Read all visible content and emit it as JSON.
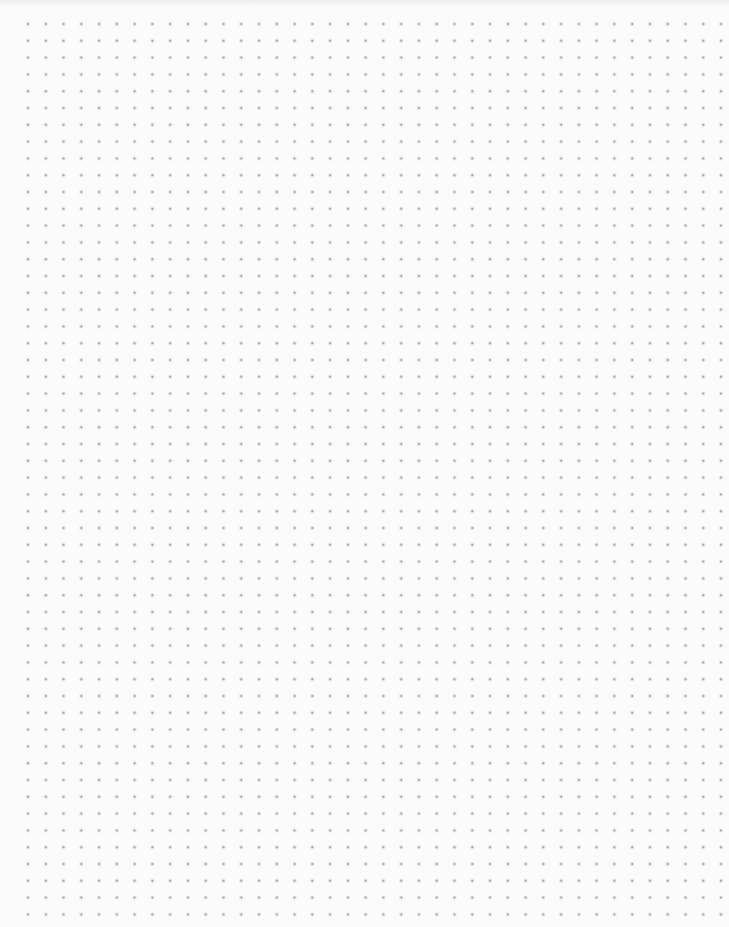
{
  "page": {
    "type": "dot-grid-paper",
    "background_color": "#fbfbfb",
    "top_band_color": "#ececec"
  },
  "grid": {
    "columns": 40,
    "rows": 54,
    "origin_x": 28,
    "origin_y": 24,
    "step_x": 17.77,
    "step_y": 16.8,
    "dot_radius": 1.0,
    "dot_color": "#a3a3a3",
    "halo_color": "#e6e6e6"
  }
}
